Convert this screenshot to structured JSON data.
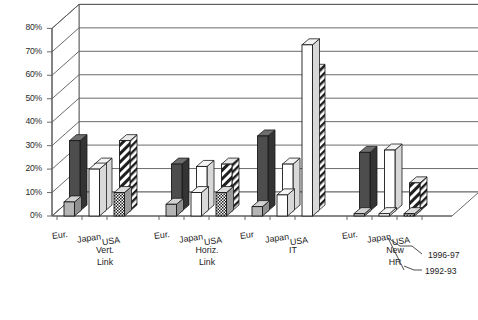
{
  "chart_data": {
    "type": "bar",
    "title": "",
    "subtitle": "",
    "xlabel": "",
    "ylabel": "",
    "ylim": [
      0,
      80
    ],
    "ytick_labels": [
      "0%",
      "10%",
      "20%",
      "30%",
      "40%",
      "50%",
      "60%",
      "70%",
      "80%"
    ],
    "ytick_values": [
      0,
      10,
      20,
      30,
      40,
      50,
      60,
      70,
      80
    ],
    "grid": true,
    "three_d": true,
    "legend_position": "right-bottom",
    "legend": [
      {
        "name": "1996-97",
        "swatch": "diagonal-hatch"
      },
      {
        "name": "1992-93",
        "swatch": "white-solid"
      }
    ],
    "series": [
      {
        "name": "1996-97",
        "values": [
          30,
          20,
          30,
          20,
          10,
          20,
          32,
          20,
          60,
          25,
          26,
          12
        ]
      },
      {
        "name": "1992-93",
        "values": [
          6,
          20,
          10,
          5,
          10,
          10,
          4,
          9,
          73,
          1,
          1,
          1
        ]
      }
    ],
    "categories": [
      "Eur.",
      "Japan",
      "USA",
      "Eur.",
      "Japan",
      "USA",
      "Eur",
      "Japan",
      "USA",
      "Eur.",
      "Japan",
      "USA"
    ],
    "groups": [
      {
        "label": "Vert. Link",
        "lines": [
          "Vert.",
          "Link"
        ],
        "categories": [
          "Eur.",
          "Japan",
          "USA"
        ]
      },
      {
        "label": "Horiz. Link",
        "lines": [
          "Horiz.",
          "Link"
        ],
        "categories": [
          "Eur.",
          "Japan",
          "USA"
        ]
      },
      {
        "label": "IT",
        "lines": [
          "IT"
        ],
        "categories": [
          "Eur",
          "Japan",
          "USA"
        ]
      },
      {
        "label": "New HR",
        "lines": [
          "New",
          "HR"
        ],
        "categories": [
          "Eur.",
          "Japan",
          "USA"
        ]
      }
    ],
    "bars": [
      {
        "group": 0,
        "category": "Eur.",
        "series": "1996-97",
        "value": 30,
        "fill": "dark-gray"
      },
      {
        "group": 0,
        "category": "Eur.",
        "series": "1992-93",
        "value": 6,
        "fill": "light-gray"
      },
      {
        "group": 0,
        "category": "Japan",
        "series": "1996-97",
        "value": 20,
        "fill": "white"
      },
      {
        "group": 0,
        "category": "Japan",
        "series": "1992-93",
        "value": 20,
        "fill": "white"
      },
      {
        "group": 0,
        "category": "USA",
        "series": "1996-97",
        "value": 30,
        "fill": "diagonal-hatch"
      },
      {
        "group": 0,
        "category": "USA",
        "series": "1992-93",
        "value": 10,
        "fill": "checker"
      },
      {
        "group": 1,
        "category": "Eur.",
        "series": "1996-97",
        "value": 20,
        "fill": "dark-gray"
      },
      {
        "group": 1,
        "category": "Eur.",
        "series": "1992-93",
        "value": 5,
        "fill": "light-gray"
      },
      {
        "group": 1,
        "category": "Japan",
        "series": "1996-97",
        "value": 19,
        "fill": "white"
      },
      {
        "group": 1,
        "category": "Japan",
        "series": "1992-93",
        "value": 10,
        "fill": "white"
      },
      {
        "group": 1,
        "category": "USA",
        "series": "1996-97",
        "value": 20,
        "fill": "diagonal-hatch"
      },
      {
        "group": 1,
        "category": "USA",
        "series": "1992-93",
        "value": 10,
        "fill": "checker"
      },
      {
        "group": 2,
        "category": "Eur",
        "series": "1996-97",
        "value": 32,
        "fill": "dark-gray"
      },
      {
        "group": 2,
        "category": "Eur",
        "series": "1992-93",
        "value": 4,
        "fill": "light-gray"
      },
      {
        "group": 2,
        "category": "Japan",
        "series": "1996-97",
        "value": 20,
        "fill": "white"
      },
      {
        "group": 2,
        "category": "Japan",
        "series": "1992-93",
        "value": 9,
        "fill": "white"
      },
      {
        "group": 2,
        "category": "USA",
        "series": "1996-97",
        "value": 60,
        "fill": "diagonal-hatch"
      },
      {
        "group": 2,
        "category": "USA",
        "series": "1992-93",
        "value": 73,
        "fill": "white"
      },
      {
        "group": 3,
        "category": "Eur.",
        "series": "1996-97",
        "value": 25,
        "fill": "dark-gray"
      },
      {
        "group": 3,
        "category": "Eur.",
        "series": "1992-93",
        "value": 1,
        "fill": "light-gray"
      },
      {
        "group": 3,
        "category": "Japan",
        "series": "1996-97",
        "value": 26,
        "fill": "white"
      },
      {
        "group": 3,
        "category": "Japan",
        "series": "1992-93",
        "value": 1,
        "fill": "white"
      },
      {
        "group": 3,
        "category": "USA",
        "series": "1996-97",
        "value": 12,
        "fill": "diagonal-hatch"
      },
      {
        "group": 3,
        "category": "USA",
        "series": "1992-93",
        "value": 1,
        "fill": "checker"
      }
    ],
    "colors": {
      "dark_gray": "#4d4d4d",
      "light_gray": "#b5b5b5",
      "white": "#ffffff",
      "outline": "#1a1a1a",
      "gridline": "#5a5a5a",
      "hatch": "#1a1a1a"
    }
  },
  "axis": {
    "y_ticks": [
      "0%",
      "10%",
      "20%",
      "30%",
      "40%",
      "50%",
      "60%",
      "70%",
      "80%"
    ]
  },
  "legend": {
    "items": [
      "1996-97",
      "1992-93"
    ]
  },
  "groups": {
    "g0": {
      "c0": "Eur.",
      "c1": "Japan",
      "c2": "USA",
      "l0": "Vert.",
      "l1": "Link"
    },
    "g1": {
      "c0": "Eur.",
      "c1": "Japan",
      "c2": "USA",
      "l0": "Horiz.",
      "l1": "Link"
    },
    "g2": {
      "c0": "Eur",
      "c1": "Japan",
      "c2": "USA",
      "l0": "IT",
      "l1": ""
    },
    "g3": {
      "c0": "Eur.",
      "c1": "Japan",
      "c2": "USA",
      "l0": "New",
      "l1": "HR"
    }
  }
}
